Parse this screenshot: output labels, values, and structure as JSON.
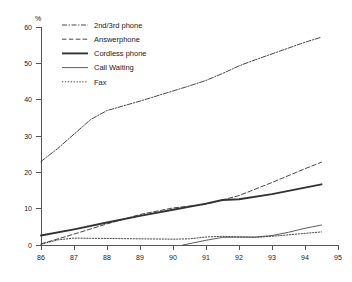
{
  "chart_data": {
    "type": "line",
    "title": "",
    "xlabel": "",
    "ylabel": "%",
    "xlim": [
      86,
      95
    ],
    "ylim": [
      0,
      60
    ],
    "xticks": [
      "86",
      "87",
      "88",
      "89",
      "90",
      "91",
      "92",
      "93",
      "94",
      "95"
    ],
    "yticks": [
      "0",
      "10",
      "20",
      "30",
      "40",
      "50",
      "60"
    ],
    "grid": false,
    "legend_position": "top-left",
    "series": [
      {
        "name": "2nd/3rd phone",
        "style": "dash-dot",
        "x": [
          86.0,
          86.5,
          87.0,
          87.5,
          88.0,
          88.5,
          89.0,
          89.5,
          90.0,
          90.5,
          91.0,
          91.5,
          92.0,
          92.5,
          93.0,
          93.5,
          94.0,
          94.5
        ],
        "values": [
          23.0,
          26.5,
          30.5,
          34.5,
          37.0,
          38.3,
          39.6,
          41.0,
          42.4,
          43.8,
          45.3,
          47.2,
          49.3,
          51.0,
          52.6,
          54.2,
          55.8,
          57.2
        ]
      },
      {
        "name": "Answerphone",
        "style": "dashed",
        "x": [
          86.0,
          87.0,
          88.0,
          89.0,
          90.0,
          91.0,
          92.0,
          93.0,
          94.0,
          94.5
        ],
        "values": [
          0.3,
          3.0,
          5.8,
          8.4,
          10.2,
          11.2,
          13.6,
          17.2,
          21.0,
          22.8
        ]
      },
      {
        "name": "Cordless phone",
        "style": "solid-thick",
        "x": [
          86.0,
          87.0,
          88.0,
          89.0,
          90.0,
          91.0,
          91.5,
          92.0,
          93.0,
          94.0,
          94.5
        ],
        "values": [
          2.6,
          4.3,
          6.2,
          8.0,
          9.7,
          11.4,
          12.4,
          12.6,
          14.0,
          15.8,
          16.7
        ]
      },
      {
        "name": "Call Waiting",
        "style": "solid-thin",
        "x": [
          90.3,
          91.0,
          91.5,
          92.0,
          92.5,
          93.0,
          93.5,
          94.0,
          94.5
        ],
        "values": [
          0.0,
          1.3,
          2.1,
          2.2,
          2.2,
          2.6,
          3.5,
          4.6,
          5.5
        ]
      },
      {
        "name": "Fax",
        "style": "dotted",
        "x": [
          86.0,
          86.5,
          87.0,
          88.0,
          89.0,
          90.0,
          90.5,
          91.0,
          91.5,
          92.0,
          92.5,
          93.0,
          93.5,
          94.0,
          94.5
        ],
        "values": [
          0.2,
          1.4,
          1.9,
          1.8,
          1.7,
          1.6,
          1.7,
          2.2,
          2.4,
          2.2,
          2.1,
          2.4,
          2.8,
          3.2,
          3.6
        ]
      }
    ]
  },
  "legend": {
    "items": [
      {
        "label": "2nd/3rd phone"
      },
      {
        "label": "Answerphone"
      },
      {
        "label": "Cordless phone"
      },
      {
        "label": "Call Waiting"
      },
      {
        "label": "Fax"
      }
    ]
  }
}
